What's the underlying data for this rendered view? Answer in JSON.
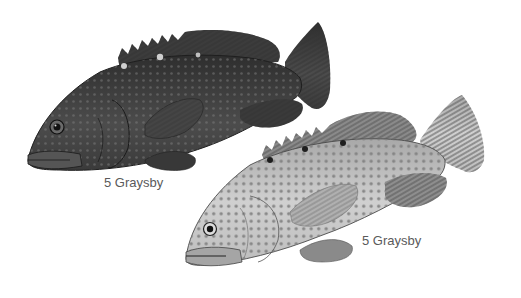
{
  "illustration": {
    "fish": [
      {
        "id": "dark-phase",
        "label": "5 Graysby",
        "body_color": "#4a4a4a",
        "spot_color": "#7a7a7a",
        "highlight_spot_color": "#cfcfcf"
      },
      {
        "id": "light-phase",
        "label": "5 Graysby",
        "body_color": "#bdbdbd",
        "spot_color": "#7d7d7d",
        "dark_spot_color": "#1e1e1e"
      }
    ]
  }
}
